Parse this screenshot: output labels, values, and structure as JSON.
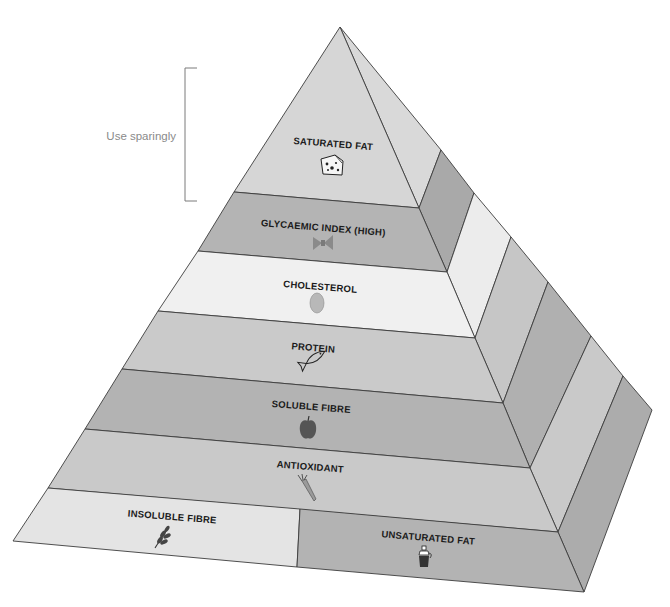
{
  "diagram": {
    "type": "food-pyramid",
    "annotation": {
      "label": "Use sparingly",
      "bracket_spans": [
        "SATURATED FAT",
        "GLYCAEMIC INDEX (HIGH)"
      ]
    },
    "levels": [
      {
        "label": "SATURATED FAT",
        "icon": "cheese-icon",
        "color": "#d6d6d6",
        "side_color": "#a9a9a9"
      },
      {
        "label": "GLYCAEMIC INDEX (HIGH)",
        "icon": "pasta-bow-icon",
        "color": "#b4b4b4",
        "side_color": "#ececec"
      },
      {
        "label": "CHOLESTEROL",
        "icon": "egg-icon",
        "color": "#f0f0f0",
        "side_color": "#c6c6c6"
      },
      {
        "label": "PROTEIN",
        "icon": "fish-icon",
        "color": "#cacaca",
        "side_color": "#b0b0b0"
      },
      {
        "label": "SOLUBLE FIBRE",
        "icon": "apple-icon",
        "color": "#b3b3b3",
        "side_color": "#c9c9c9"
      },
      {
        "label": "ANTIOXIDANT",
        "icon": "carrot-icon",
        "color": "#c9c9c9",
        "side_color": "#acacac"
      }
    ],
    "base": [
      {
        "label": "INSOLUBLE FIBRE",
        "icon": "wheat-icon",
        "color": "#e4e4e4"
      },
      {
        "label": "UNSATURATED FAT",
        "icon": "olive-oil-bottle-icon",
        "color": "#b3b3b3"
      }
    ],
    "base_side_color": "#acacac",
    "edge_color": "#3c3c3c"
  }
}
